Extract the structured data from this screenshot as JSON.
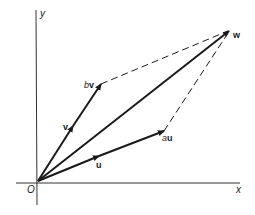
{
  "diagram": {
    "type": "vector-parallelogram",
    "colors": {
      "ink": "#1a1a1a",
      "background": "#ffffff"
    },
    "axes": {
      "x_label": "x",
      "y_label": "y",
      "origin_label": "O"
    },
    "vectors": [
      {
        "id": "u",
        "label": "u",
        "from": "O",
        "to": "au",
        "arrow_midway": true
      },
      {
        "id": "v",
        "label": "v",
        "from": "O",
        "to": "bv",
        "arrow_midway": true
      },
      {
        "id": "au",
        "label": "au",
        "scalar": "a"
      },
      {
        "id": "bv",
        "label": "bv",
        "scalar": "b"
      },
      {
        "id": "w",
        "label": "w",
        "from": "O",
        "note": "w = au + bv"
      }
    ],
    "dashed_lines": [
      {
        "from": "bv",
        "to": "w"
      },
      {
        "from": "au",
        "to": "w"
      }
    ],
    "labels": {
      "y": "y",
      "x": "x",
      "O": "O",
      "v": "v",
      "u": "u",
      "bv_scalar": "b",
      "bv_vec": "v",
      "au_scalar": "a",
      "au_vec": "u",
      "w": "w"
    }
  }
}
